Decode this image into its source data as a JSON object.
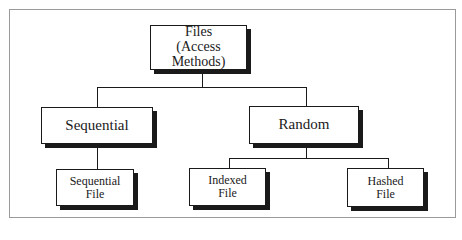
{
  "diagram": {
    "type": "tree",
    "root": {
      "line1": "Files",
      "line2": "(Access Methods)"
    },
    "level1": [
      {
        "id": "sequential",
        "label": "Sequential"
      },
      {
        "id": "random",
        "label": "Random"
      }
    ],
    "level2": [
      {
        "id": "sequential-file",
        "parent": "sequential",
        "line1": "Sequential",
        "line2": "File"
      },
      {
        "id": "indexed-file",
        "parent": "random",
        "line1": "Indexed",
        "line2": "File"
      },
      {
        "id": "hashed-file",
        "parent": "random",
        "line1": "Hashed",
        "line2": "File"
      }
    ],
    "colors": {
      "line": "#1a1a1a",
      "frame": "#9a9a9a",
      "background": "#ffffff"
    }
  }
}
